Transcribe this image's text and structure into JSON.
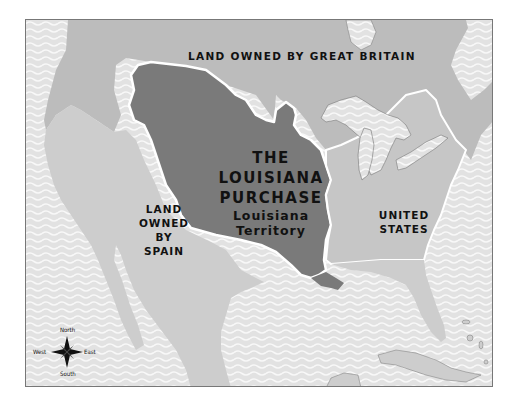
{
  "map": {
    "title": "THE LOUISIANA PURCHASE",
    "colors": {
      "water": "#e4e4e4",
      "water_wave": "#f7f7f7",
      "land_other": "#bcbcbc",
      "land_spain": "#cdcdcd",
      "land_us": "#c6c6c6",
      "louisiana": "#7a7a7a",
      "border": "#ffffff",
      "frame": "#777777"
    },
    "regions": {
      "great_britain": {
        "label": "LAND OWNED BY GREAT BRITAIN"
      },
      "louisiana": {
        "title_line1": "THE",
        "title_line2": "LOUISIANA",
        "title_line3": "PURCHASE",
        "subtitle_line1": "Louisiana",
        "subtitle_line2": "Territory"
      },
      "spain": {
        "line1": "LAND",
        "line2": "OWNED",
        "line3": "BY",
        "line4": "SPAIN"
      },
      "united_states": {
        "line1": "UNITED",
        "line2": "STATES"
      }
    },
    "compass": {
      "north": "North",
      "south": "South",
      "east": "East",
      "west": "West"
    }
  }
}
